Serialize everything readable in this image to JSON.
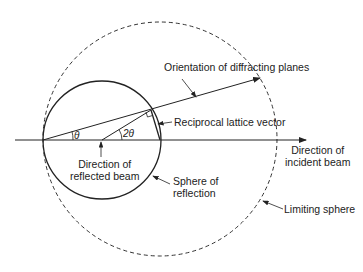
{
  "labels": {
    "planes": "Orientation of diffracting planes",
    "reciprocal": "Reciprocal lattice vector",
    "incident_1": "Direction of",
    "incident_2": "incident beam",
    "reflected_1": "Direction of",
    "reflected_2": "reflected beam",
    "sphere_refl_1": "Sphere of",
    "sphere_refl_2": "reflection",
    "limiting": "Limiting sphere",
    "theta": "θ",
    "two_theta": "2θ"
  },
  "colors": {
    "line": "#222222",
    "background": "#ffffff"
  }
}
